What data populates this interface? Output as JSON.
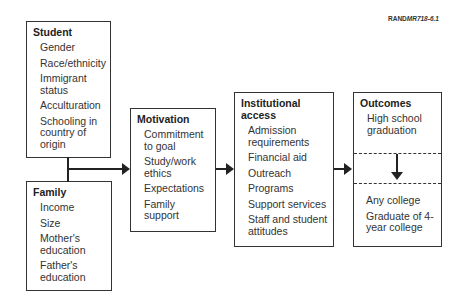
{
  "figure_id": "RAND MR718-6.1",
  "figure_id_prefix": "RAND",
  "figure_id_suffix": "MR718-6.1",
  "student": {
    "title": "Student",
    "items": [
      "Gender",
      "Race/ethnicity",
      "Immigrant status",
      "Acculturation",
      "Schooling in country of origin"
    ]
  },
  "family": {
    "title": "Family",
    "items": [
      "Income",
      "Size",
      "Mother's education",
      "Father's education"
    ]
  },
  "motivation": {
    "title": "Motivation",
    "items": [
      "Commitment to goal",
      "Study/work ethics",
      "Expectations",
      "Family support"
    ]
  },
  "institutional": {
    "title": "Institutional access",
    "items": [
      "Admission requirements",
      "Financial aid",
      "Outreach",
      "Programs",
      "Support services",
      "Staff and student attitudes"
    ]
  },
  "outcomes": {
    "title": "Outcomes",
    "top_items": [
      "High school graduation"
    ],
    "bottom_items": [
      "Any college",
      "Graduate of 4-year college"
    ]
  }
}
